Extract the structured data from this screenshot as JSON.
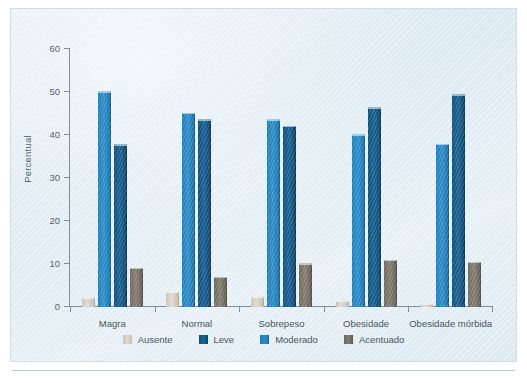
{
  "figure": {
    "background_color": "#e0ecf4",
    "plot_border_color": "#cfdde7"
  },
  "chart_data": {
    "type": "bar",
    "title": "",
    "subtitle": "",
    "xlabel": "",
    "ylabel": "Percentual",
    "ylim": [
      0,
      60
    ],
    "yticks": [
      0,
      10,
      20,
      30,
      40,
      50,
      60
    ],
    "ytick_labels": [
      "0",
      "10",
      "20",
      "30",
      "40",
      "50",
      "60"
    ],
    "grid": false,
    "legend_position": "bottom",
    "categories": [
      "Magra",
      "Normal",
      "Sobrepeso",
      "Obesidade",
      "Obesidade mórbida"
    ],
    "series": [
      {
        "name": "Ausente",
        "color": "#d5cec1",
        "values": [
          2.3,
          3.5,
          2.5,
          1.4,
          0.8
        ]
      },
      {
        "name": "Moderado",
        "color": "#1b7ebc",
        "values": [
          50.2,
          45.2,
          43.7,
          40.2,
          38.0
        ]
      },
      {
        "name": "Leve",
        "color": "#10517c",
        "values": [
          37.8,
          43.7,
          42.2,
          46.5,
          49.5
        ]
      },
      {
        "name": "Acentuado",
        "color": "#6f6960",
        "values": [
          9.1,
          7.0,
          10.2,
          11.0,
          10.5
        ]
      }
    ],
    "bar_order": [
      "Ausente",
      "Moderado",
      "Leve",
      "Acentuado"
    ],
    "legend_order": [
      "Ausente",
      "Leve",
      "Moderado",
      "Acentuado"
    ]
  },
  "legend": {
    "items": [
      {
        "label": "Ausente",
        "swatch_class": "sw-ausente"
      },
      {
        "label": "Leve",
        "swatch_class": "sw-leve"
      },
      {
        "label": "Moderado",
        "swatch_class": "sw-moderado"
      },
      {
        "label": "Acentuado",
        "swatch_class": "sw-acentuado"
      }
    ]
  }
}
